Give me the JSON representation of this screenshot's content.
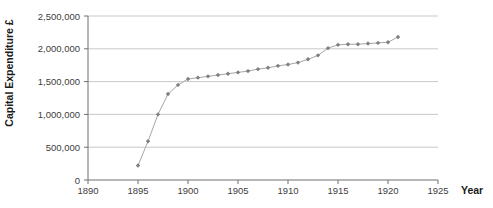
{
  "chart_data": {
    "type": "line",
    "title": "",
    "xlabel": "Year",
    "ylabel": "Capital Expenditure £",
    "xlim": [
      1890,
      1925
    ],
    "ylim": [
      0,
      2500000
    ],
    "x_ticks": [
      1890,
      1895,
      1900,
      1905,
      1910,
      1915,
      1920,
      1925
    ],
    "x_tick_labels": [
      "1890",
      "1895",
      "1900",
      "1905",
      "1910",
      "1915",
      "1920",
      "1925"
    ],
    "y_ticks": [
      0,
      500000,
      1000000,
      1500000,
      2000000,
      2500000
    ],
    "y_tick_labels": [
      "0",
      "500,000",
      "1,000,000",
      "1,500,000",
      "2,000,000",
      "2,500,000"
    ],
    "grid": "horizontal",
    "legend_position": "none",
    "marker": "diamond",
    "series": [
      {
        "name": "Capital Expenditure",
        "x": [
          1895,
          1896,
          1897,
          1898,
          1899,
          1900,
          1901,
          1902,
          1903,
          1904,
          1905,
          1906,
          1907,
          1908,
          1909,
          1910,
          1911,
          1912,
          1913,
          1914,
          1915,
          1916,
          1917,
          1918,
          1919,
          1920,
          1921
        ],
        "y": [
          220000,
          590000,
          1000000,
          1310000,
          1450000,
          1540000,
          1560000,
          1580000,
          1600000,
          1620000,
          1640000,
          1660000,
          1690000,
          1710000,
          1740000,
          1760000,
          1790000,
          1840000,
          1900000,
          2010000,
          2060000,
          2070000,
          2070000,
          2080000,
          2090000,
          2100000,
          2180000
        ]
      }
    ],
    "colors": {
      "line": "#a6a6a6",
      "marker": "#7f7f7f",
      "grid": "#c9c9c9",
      "axis": "#6e6e6e",
      "tick_text": "#404040",
      "title_text": "#1a1a1a",
      "background": "#ffffff"
    }
  }
}
